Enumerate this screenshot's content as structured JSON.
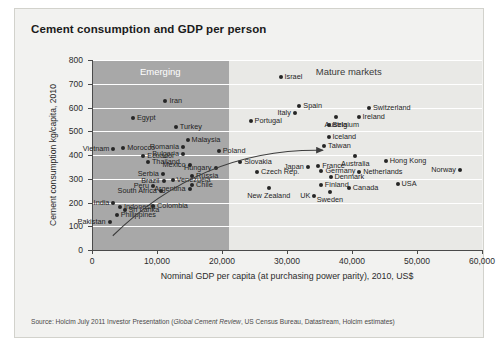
{
  "slide": {
    "title": "Cement consumption and GDP per person",
    "source_prefix": "Source: Holcim July 2011 Investor Presentation (",
    "source_italic": "Global Cement Review",
    "source_suffix": ", US Census Bureau, Datastream, Holcim estimates)"
  },
  "colors": {
    "slide_bg": "#f2f2f0",
    "plot_bg": "#e9e9e6",
    "emerging_band": "#a8a8a8",
    "gridline": "#ffffff",
    "axis": "#4a4a4a",
    "point": "#262626",
    "text": "#1f1f1f"
  },
  "chart_data": {
    "type": "scatter",
    "title": "Cement consumption and GDP per person",
    "xlabel": "Nominal GDP per capita (at purchasing power parity), 2010, US$",
    "ylabel": "Cement consumption kg/capita, 2010",
    "xlim": [
      0,
      60000
    ],
    "ylim": [
      0,
      800
    ],
    "xticks": [
      0,
      10000,
      20000,
      30000,
      40000,
      50000,
      60000
    ],
    "xticklabels": [
      "0",
      "10,000",
      "20,000",
      "30,000",
      "40,000",
      "50,000",
      "60,000"
    ],
    "yticks": [
      0,
      100,
      200,
      300,
      400,
      500,
      600,
      700,
      800
    ],
    "yticklabels": [
      "0",
      "100",
      "200",
      "300",
      "400",
      "500",
      "600",
      "700",
      "800"
    ],
    "grid": "horizontal",
    "legend": "none",
    "regions": [
      {
        "name": "Emerging",
        "label": "Emerging",
        "x_from": 0,
        "x_to": 21000,
        "label_x": 10500,
        "label_y": 755
      },
      {
        "name": "Mature markets",
        "label": "Mature markets",
        "x_from": 21000,
        "x_to": 60000,
        "label_x": 39500,
        "label_y": 755
      }
    ],
    "annotation_arrow": {
      "description": "curved development-path arrow from low income/low consumption toward mature markets",
      "from": [
        3200,
        60
      ],
      "control": [
        17000,
        430
      ],
      "to": [
        35500,
        420
      ]
    },
    "points": [
      {
        "label": "Iran",
        "x": 11300,
        "y": 628,
        "anchor": "r"
      },
      {
        "label": "Egypt",
        "x": 6300,
        "y": 556,
        "anchor": "r"
      },
      {
        "label": "Turkey",
        "x": 12900,
        "y": 518,
        "anchor": "r"
      },
      {
        "label": "Malaysia",
        "x": 14700,
        "y": 462,
        "anchor": "r"
      },
      {
        "label": "Morocco",
        "x": 4800,
        "y": 430,
        "anchor": "r"
      },
      {
        "label": "Romania",
        "x": 14000,
        "y": 432,
        "anchor": "l"
      },
      {
        "label": "Vietnam",
        "x": 3300,
        "y": 424,
        "anchor": "l"
      },
      {
        "label": "Bulgaria",
        "x": 14000,
        "y": 404,
        "anchor": "l"
      },
      {
        "label": "Ecuador",
        "x": 7900,
        "y": 396,
        "anchor": "r"
      },
      {
        "label": "Poland",
        "x": 19500,
        "y": 416,
        "anchor": "r"
      },
      {
        "label": "Thailand",
        "x": 8600,
        "y": 370,
        "anchor": "r"
      },
      {
        "label": "Mexico",
        "x": 15000,
        "y": 356,
        "anchor": "l"
      },
      {
        "label": "Hungary",
        "x": 19000,
        "y": 346,
        "anchor": "l"
      },
      {
        "label": "Slovakia",
        "x": 22800,
        "y": 372,
        "anchor": "r"
      },
      {
        "label": "Serbia",
        "x": 10900,
        "y": 322,
        "anchor": "l"
      },
      {
        "label": "Russia",
        "x": 15400,
        "y": 312,
        "anchor": "r"
      },
      {
        "label": "Venezuela",
        "x": 12400,
        "y": 296,
        "anchor": "r"
      },
      {
        "label": "Brazil",
        "x": 11000,
        "y": 290,
        "anchor": "l"
      },
      {
        "label": "Chile",
        "x": 15400,
        "y": 274,
        "anchor": "r"
      },
      {
        "label": "Peru",
        "x": 9400,
        "y": 268,
        "anchor": "l"
      },
      {
        "label": "Argentina",
        "x": 15000,
        "y": 256,
        "anchor": "l"
      },
      {
        "label": "South Africa",
        "x": 10600,
        "y": 248,
        "anchor": "l"
      },
      {
        "label": "Czech Rep.",
        "x": 25400,
        "y": 330,
        "anchor": "r"
      },
      {
        "label": "India",
        "x": 3300,
        "y": 196,
        "anchor": "l"
      },
      {
        "label": "Indonesia",
        "x": 4300,
        "y": 182,
        "anchor": "r"
      },
      {
        "label": "Colombia",
        "x": 9400,
        "y": 186,
        "anchor": "r"
      },
      {
        "label": "Sri Lanka",
        "x": 5000,
        "y": 168,
        "anchor": "r"
      },
      {
        "label": "Philippines",
        "x": 3800,
        "y": 146,
        "anchor": "r"
      },
      {
        "label": "Pakistan",
        "x": 2700,
        "y": 116,
        "anchor": "l"
      },
      {
        "label": "Israel",
        "x": 29000,
        "y": 730,
        "anchor": "r"
      },
      {
        "label": "Spain",
        "x": 31900,
        "y": 606,
        "anchor": "r"
      },
      {
        "label": "Italy",
        "x": 31200,
        "y": 578,
        "anchor": "l"
      },
      {
        "label": "Switzerland",
        "x": 42600,
        "y": 598,
        "anchor": "r"
      },
      {
        "label": "Austria",
        "x": 37500,
        "y": 562,
        "anchor": "c"
      },
      {
        "label": "Ireland",
        "x": 41000,
        "y": 560,
        "anchor": "r"
      },
      {
        "label": "Belgium",
        "x": 36400,
        "y": 528,
        "anchor": "r"
      },
      {
        "label": "Portugal",
        "x": 24400,
        "y": 544,
        "anchor": "r"
      },
      {
        "label": "Iceland",
        "x": 36400,
        "y": 474,
        "anchor": "r"
      },
      {
        "label": "Taiwan",
        "x": 35700,
        "y": 440,
        "anchor": "r"
      },
      {
        "label": "Australia",
        "x": 40500,
        "y": 394,
        "anchor": "c"
      },
      {
        "label": "Hong Kong",
        "x": 45200,
        "y": 374,
        "anchor": "r"
      },
      {
        "label": "Japan",
        "x": 33200,
        "y": 350,
        "anchor": "l"
      },
      {
        "label": "France",
        "x": 34800,
        "y": 352,
        "anchor": "r"
      },
      {
        "label": "Germany",
        "x": 35300,
        "y": 334,
        "anchor": "r"
      },
      {
        "label": "Netherlands",
        "x": 41100,
        "y": 330,
        "anchor": "r"
      },
      {
        "label": "Denmark",
        "x": 36700,
        "y": 306,
        "anchor": "r"
      },
      {
        "label": "Norway",
        "x": 56600,
        "y": 336,
        "anchor": "l"
      },
      {
        "label": "USA",
        "x": 47000,
        "y": 278,
        "anchor": "r"
      },
      {
        "label": "Canada",
        "x": 39500,
        "y": 262,
        "anchor": "r"
      },
      {
        "label": "Finland",
        "x": 35200,
        "y": 272,
        "anchor": "r"
      },
      {
        "label": "New Zealand",
        "x": 27200,
        "y": 262,
        "anchor": "c"
      },
      {
        "label": "UK",
        "x": 34200,
        "y": 228,
        "anchor": "l"
      },
      {
        "label": "Sweden",
        "x": 36600,
        "y": 244,
        "anchor": "c"
      }
    ]
  }
}
